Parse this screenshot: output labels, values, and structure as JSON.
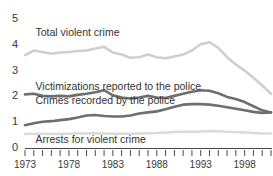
{
  "chart_data": {
    "type": "line",
    "title": "",
    "subtitle": "",
    "xlabel": "",
    "ylabel": "",
    "xlim": [
      1973,
      2001
    ],
    "ylim": [
      0,
      5
    ],
    "yticks": [
      "0",
      "1",
      "2",
      "3",
      "4",
      "5"
    ],
    "grid": false,
    "legend_position": "inline-labels",
    "x": [
      1973,
      1974,
      1975,
      1976,
      1977,
      1978,
      1979,
      1980,
      1981,
      1982,
      1983,
      1984,
      1985,
      1986,
      1987,
      1988,
      1989,
      1990,
      1991,
      1992,
      1993,
      1994,
      1995,
      1996,
      1997,
      1998,
      1999,
      2000,
      2001
    ],
    "xtick_labels": [
      "1973",
      "1978",
      "1983",
      "1988",
      "1993",
      "1998"
    ],
    "xtick_label_values": [
      1973,
      1978,
      1983,
      1988,
      1993,
      1998
    ],
    "series": [
      {
        "name": "Total violent crime",
        "color": "#cfcfcf",
        "width": 2.6,
        "label_x": 1974.2,
        "label_y": 4.45,
        "values": [
          3.6,
          3.78,
          3.72,
          3.65,
          3.7,
          3.72,
          3.76,
          3.78,
          3.86,
          3.92,
          3.7,
          3.62,
          3.5,
          3.52,
          3.62,
          3.52,
          3.48,
          3.55,
          3.62,
          3.78,
          4.02,
          4.1,
          3.88,
          3.52,
          3.24,
          3.0,
          2.72,
          2.42,
          2.1
        ]
      },
      {
        "name": "Victimizations reported to the police",
        "color": "#6e6e6e",
        "width": 2.6,
        "label_x": 1974.2,
        "label_y": 2.38,
        "values": [
          2.08,
          2.1,
          2.02,
          2.0,
          2.02,
          2.0,
          2.06,
          2.1,
          2.16,
          2.24,
          2.04,
          1.96,
          1.92,
          1.96,
          2.02,
          1.96,
          1.94,
          2.02,
          2.1,
          2.18,
          2.24,
          2.22,
          2.12,
          1.98,
          1.9,
          1.78,
          1.62,
          1.46,
          1.38
        ]
      },
      {
        "name": "Crimes recorded by the police",
        "color": "#6e6e6e",
        "width": 2.6,
        "label_x": 1974.2,
        "label_y": 1.82,
        "values": [
          0.88,
          0.96,
          1.02,
          1.04,
          1.08,
          1.12,
          1.18,
          1.26,
          1.28,
          1.24,
          1.22,
          1.22,
          1.26,
          1.34,
          1.38,
          1.42,
          1.5,
          1.6,
          1.68,
          1.7,
          1.7,
          1.68,
          1.64,
          1.58,
          1.52,
          1.46,
          1.4,
          1.36,
          1.38
        ]
      },
      {
        "name": "Arrests for violent crime",
        "color": "#dadada",
        "width": 2.6,
        "label_x": 1974.2,
        "label_y": 0.3,
        "values": [
          0.54,
          0.55,
          0.55,
          0.54,
          0.54,
          0.55,
          0.56,
          0.56,
          0.57,
          0.56,
          0.55,
          0.55,
          0.55,
          0.56,
          0.57,
          0.58,
          0.6,
          0.62,
          0.63,
          0.63,
          0.64,
          0.66,
          0.65,
          0.63,
          0.62,
          0.6,
          0.58,
          0.56,
          0.56
        ]
      }
    ]
  },
  "axis": {
    "color": "#4a4a4a",
    "tick_color": "#4a4a4a"
  }
}
